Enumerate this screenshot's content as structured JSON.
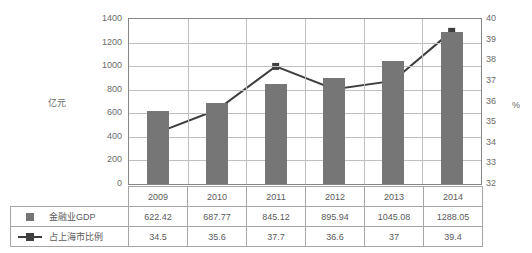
{
  "chart_data": {
    "type": "bar",
    "title": "",
    "categories": [
      "2009",
      "2010",
      "2011",
      "2012",
      "2013",
      "2014"
    ],
    "series": [
      {
        "name": "金融业GDP",
        "type": "bar",
        "axis": "left",
        "values": [
          622.42,
          687.77,
          845.12,
          895.94,
          1045.08,
          1288.05
        ],
        "color": "#767676"
      },
      {
        "name": "占上海市比例",
        "type": "line",
        "axis": "right",
        "values": [
          34.5,
          35.6,
          37.7,
          36.6,
          37,
          39.4
        ],
        "color": "#3f3f3f"
      }
    ],
    "xlabel": "",
    "ylabel": "亿元",
    "y2label": "%",
    "ylim": [
      0,
      1400
    ],
    "y2lim": [
      32,
      40
    ],
    "yticks": [
      "0",
      "200",
      "400",
      "600",
      "800",
      "1000",
      "1200",
      "1400"
    ],
    "y2ticks": [
      "32",
      "33",
      "34",
      "35",
      "36",
      "37",
      "38",
      "39",
      "40"
    ],
    "grid": true,
    "legend_position": "bottom-table"
  },
  "axes": {
    "left_title": "亿元",
    "right_title": "%",
    "left_ticks": [
      "1400",
      "1200",
      "1000",
      "800",
      "600",
      "400",
      "200",
      "0"
    ],
    "right_ticks": [
      "40",
      "39",
      "38",
      "37",
      "36",
      "35",
      "34",
      "33",
      "32"
    ]
  },
  "table": {
    "header": [
      "",
      "2009",
      "2010",
      "2011",
      "2012",
      "2013",
      "2014"
    ],
    "rows": [
      {
        "label": "金融业GDP",
        "marker": "square-icon",
        "values": [
          "622.42",
          "687.77",
          "845.12",
          "895.94",
          "1045.08",
          "1288.05"
        ]
      },
      {
        "label": "占上海市比例",
        "marker": "line-marker-icon",
        "values": [
          "34.5",
          "35.6",
          "37.7",
          "36.6",
          "37",
          "39.4"
        ]
      }
    ]
  },
  "colors": {
    "bar": "#767676",
    "line": "#3f3f3f",
    "grid": "#bfbfbf",
    "axis": "#868686",
    "text": "#5a5a5a"
  }
}
